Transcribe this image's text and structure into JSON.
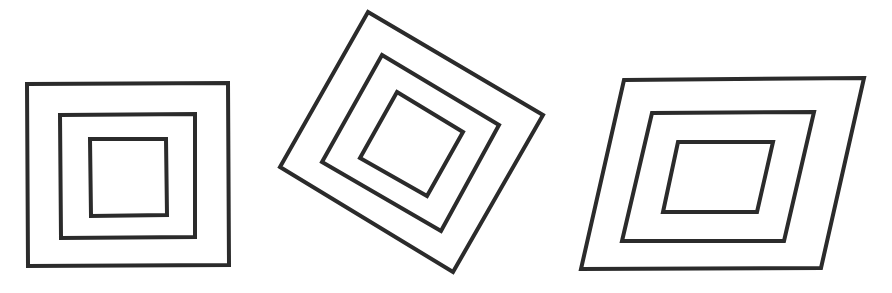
{
  "diagram": {
    "background": "#ffffff",
    "stroke_color": "#2b2b2b",
    "stroke_width": 4,
    "figures": [
      {
        "name": "upright-nested-squares",
        "description": "Three nested axis-aligned quadrilaterals",
        "polygons": [
          {
            "level": "outer",
            "points": "27,84 228,83 229,265 28,266"
          },
          {
            "level": "middle",
            "points": "60,115 195,114 195,237 61,238"
          },
          {
            "level": "inner",
            "points": "90,139 166,139 167,215 91,216"
          }
        ]
      },
      {
        "name": "rotated-nested-squares",
        "description": "Three nested quadrilaterals rotated about 30 degrees",
        "polygons": [
          {
            "level": "outer",
            "points": "368,12 543,115 453,272 280,167"
          },
          {
            "level": "middle",
            "points": "382,55 499,125 441,231 322,162"
          },
          {
            "level": "inner",
            "points": "397,92 463,132 427,196 360,158"
          }
        ]
      },
      {
        "name": "sheared-nested-parallelograms",
        "description": "Three nested parallelograms sheared to the right",
        "polygons": [
          {
            "level": "outer",
            "points": "624,80 864,78 821,268 581,269"
          },
          {
            "level": "middle",
            "points": "652,113 814,112 784,241 622,241"
          },
          {
            "level": "inner",
            "points": "678,142 773,142 757,212 663,212"
          }
        ]
      }
    ]
  }
}
